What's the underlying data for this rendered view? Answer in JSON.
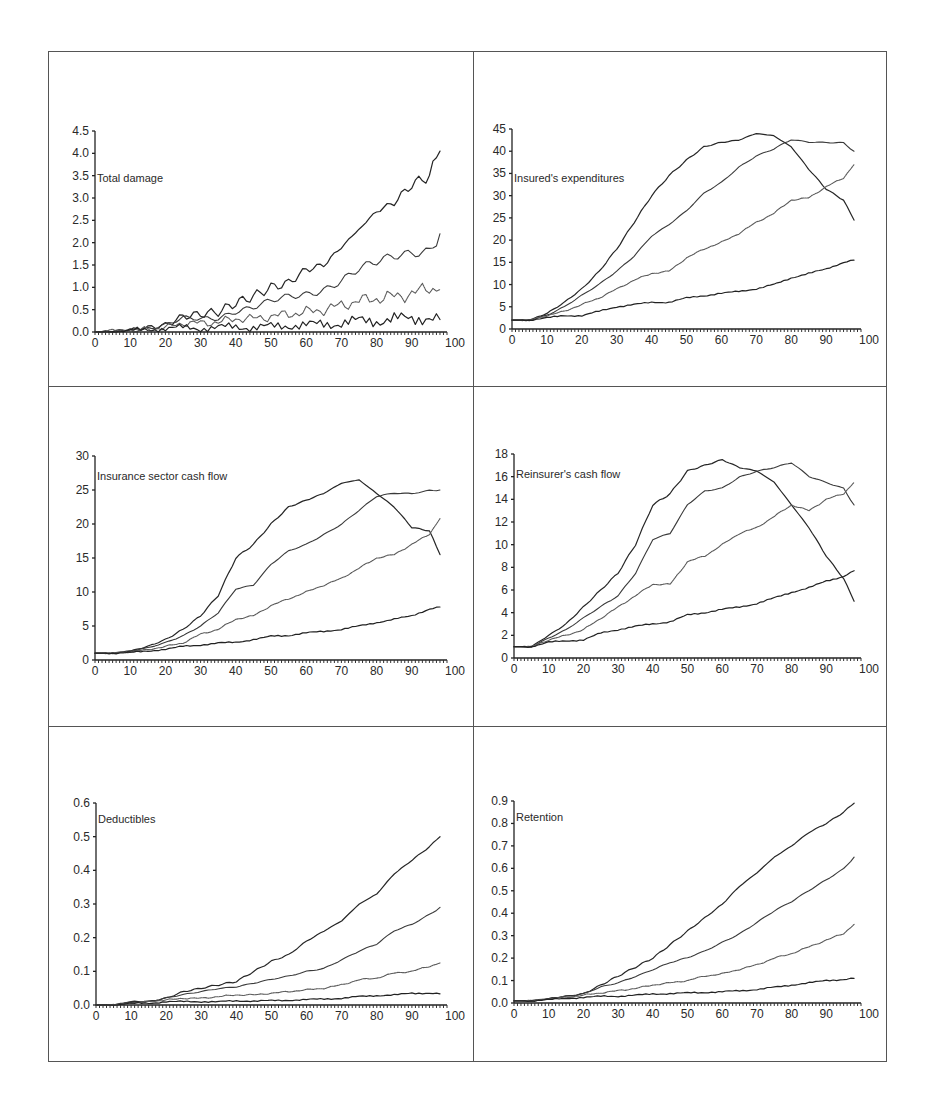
{
  "figure": {
    "panels_layout": "3 rows x 2 columns",
    "line_color": "#2b2b2b",
    "series_styles": [
      {
        "stroke": "#262626",
        "width": 1.2,
        "dash": ""
      },
      {
        "stroke": "#3a3a3a",
        "width": 1.1,
        "dash": ""
      },
      {
        "stroke": "#5a5a5a",
        "width": 1.1,
        "dash": "1.5,0.8"
      },
      {
        "stroke": "#222222",
        "width": 1.2,
        "dash": ""
      }
    ]
  },
  "chart_data": [
    {
      "id": "total-damage",
      "type": "line",
      "title": "Total damage",
      "xlabel": "",
      "ylabel": "",
      "xlim": [
        0,
        100
      ],
      "ylim": [
        0,
        4.5
      ],
      "yticks": [
        "0.0",
        "0.5",
        "1.0",
        "1.5",
        "2.0",
        "2.5",
        "3.0",
        "3.5",
        "4.0",
        "4.5"
      ],
      "ytick_values": [
        0,
        0.5,
        1,
        1.5,
        2,
        2.5,
        3,
        3.5,
        4,
        4.5
      ],
      "xticks": [
        "0",
        "10",
        "20",
        "30",
        "40",
        "50",
        "60",
        "70",
        "80",
        "90",
        "100"
      ],
      "grid": false,
      "legend": "none",
      "x": [
        0,
        5,
        10,
        15,
        20,
        25,
        30,
        35,
        40,
        45,
        50,
        55,
        60,
        65,
        70,
        75,
        80,
        85,
        90,
        95,
        98
      ],
      "series": [
        {
          "name": "series-1",
          "values": [
            0,
            0.02,
            0.05,
            0.1,
            0.15,
            0.35,
            0.4,
            0.45,
            0.65,
            0.8,
            1.0,
            1.1,
            1.4,
            1.5,
            1.9,
            2.3,
            2.7,
            2.9,
            3.3,
            3.5,
            4.05
          ]
        },
        {
          "name": "series-2",
          "values": [
            0,
            0.02,
            0.05,
            0.08,
            0.12,
            0.28,
            0.3,
            0.35,
            0.5,
            0.55,
            0.65,
            0.75,
            0.85,
            1.0,
            1.2,
            1.4,
            1.5,
            1.65,
            1.8,
            1.9,
            2.2
          ]
        },
        {
          "name": "series-3",
          "values": [
            0,
            0.02,
            0.04,
            0.06,
            0.1,
            0.2,
            0.2,
            0.22,
            0.3,
            0.3,
            0.35,
            0.4,
            0.45,
            0.5,
            0.6,
            0.7,
            0.75,
            0.8,
            0.85,
            1.0,
            0.95
          ]
        },
        {
          "name": "series-4",
          "values": [
            0,
            0.01,
            0.03,
            0.05,
            0.08,
            0.1,
            0.08,
            0.1,
            0.12,
            0.1,
            0.12,
            0.15,
            0.15,
            0.18,
            0.2,
            0.25,
            0.25,
            0.3,
            0.28,
            0.35,
            0.28
          ]
        }
      ]
    },
    {
      "id": "insureds-expenditures",
      "type": "line",
      "title": "Insured's expenditures",
      "xlabel": "",
      "ylabel": "",
      "xlim": [
        0,
        100
      ],
      "ylim": [
        0,
        45
      ],
      "yticks": [
        "0",
        "5",
        "10",
        "15",
        "20",
        "25",
        "30",
        "35",
        "40",
        "45"
      ],
      "ytick_values": [
        0,
        5,
        10,
        15,
        20,
        25,
        30,
        35,
        40,
        45
      ],
      "xticks": [
        "0",
        "10",
        "20",
        "30",
        "40",
        "50",
        "60",
        "70",
        "80",
        "90",
        "100"
      ],
      "grid": false,
      "legend": "none",
      "x": [
        0,
        5,
        10,
        15,
        20,
        25,
        30,
        35,
        40,
        45,
        50,
        55,
        60,
        65,
        70,
        75,
        80,
        85,
        90,
        95,
        98
      ],
      "series": [
        {
          "name": "series-1",
          "values": [
            2,
            2,
            3.5,
            6,
            9,
            13,
            18,
            24,
            30,
            34.5,
            38,
            41,
            42,
            42.5,
            44,
            43.5,
            41,
            36,
            31.5,
            29,
            24.5
          ]
        },
        {
          "name": "series-2",
          "values": [
            2,
            2,
            3.2,
            5,
            7.5,
            10,
            13,
            16.5,
            21,
            23.5,
            26.5,
            30.5,
            33,
            36.5,
            39,
            40.5,
            42.5,
            42,
            42,
            42,
            40
          ]
        },
        {
          "name": "series-3",
          "values": [
            2,
            2,
            3,
            4,
            5.5,
            7,
            9,
            11,
            12.5,
            13,
            16,
            18,
            19.5,
            21.5,
            24,
            26,
            29,
            29.5,
            32,
            34,
            37
          ]
        },
        {
          "name": "series-4",
          "values": [
            2,
            2,
            2.5,
            3,
            3,
            4,
            5,
            5.5,
            6,
            6,
            7,
            7.5,
            8,
            8.5,
            9,
            10,
            11.5,
            12.5,
            13.5,
            15,
            15.5
          ]
        }
      ]
    },
    {
      "id": "insurance-sector-cash-flow",
      "type": "line",
      "title": "Insurance sector cash flow",
      "xlabel": "",
      "ylabel": "",
      "xlim": [
        0,
        100
      ],
      "ylim": [
        0,
        30
      ],
      "yticks": [
        "0",
        "5",
        "10",
        "15",
        "20",
        "25",
        "30"
      ],
      "ytick_values": [
        0,
        5,
        10,
        15,
        20,
        25,
        30
      ],
      "xticks": [
        "0",
        "10",
        "20",
        "30",
        "40",
        "50",
        "60",
        "70",
        "80",
        "90",
        "100"
      ],
      "grid": false,
      "legend": "none",
      "x": [
        0,
        5,
        10,
        15,
        20,
        25,
        30,
        35,
        40,
        45,
        50,
        55,
        60,
        65,
        70,
        75,
        80,
        85,
        90,
        95,
        98
      ],
      "series": [
        {
          "name": "series-1",
          "values": [
            1,
            1,
            1.3,
            2,
            3,
            4.5,
            6.5,
            9.5,
            15,
            17,
            20,
            22.5,
            23.5,
            24.5,
            26,
            26.5,
            24.5,
            22.5,
            19.5,
            19,
            15.5
          ]
        },
        {
          "name": "series-2",
          "values": [
            1,
            1,
            1.4,
            1.8,
            2.5,
            3.5,
            5,
            7,
            10.5,
            11,
            14,
            16,
            17,
            18.5,
            20,
            22,
            24,
            24.5,
            24.5,
            25,
            25
          ]
        },
        {
          "name": "series-3",
          "values": [
            1,
            1,
            1.2,
            1.5,
            2,
            2.5,
            3.8,
            4.5,
            6,
            6.5,
            8,
            9,
            10,
            11,
            12,
            13.5,
            15,
            15.5,
            17,
            18.5,
            20.8
          ]
        },
        {
          "name": "series-4",
          "values": [
            1,
            1,
            1.1,
            1.3,
            1.6,
            2,
            2.2,
            2.5,
            2.6,
            3,
            3.5,
            3.6,
            4,
            4.2,
            4.5,
            5,
            5.5,
            6,
            6.5,
            7.5,
            7.8
          ]
        }
      ]
    },
    {
      "id": "reinsurers-cash-flow",
      "type": "line",
      "title": "Reinsurer's cash flow",
      "xlabel": "",
      "ylabel": "",
      "xlim": [
        0,
        100
      ],
      "ylim": [
        0,
        18
      ],
      "yticks": [
        "0",
        "2",
        "4",
        "6",
        "8",
        "10",
        "12",
        "14",
        "16",
        "18"
      ],
      "ytick_values": [
        0,
        2,
        4,
        6,
        8,
        10,
        12,
        14,
        16,
        18
      ],
      "xticks": [
        "0",
        "10",
        "20",
        "30",
        "40",
        "50",
        "60",
        "70",
        "80",
        "90",
        "100"
      ],
      "grid": false,
      "legend": "none",
      "x": [
        0,
        5,
        10,
        15,
        20,
        25,
        30,
        35,
        40,
        45,
        50,
        55,
        60,
        65,
        70,
        75,
        80,
        85,
        90,
        95,
        98
      ],
      "series": [
        {
          "name": "series-1",
          "values": [
            1,
            1,
            2,
            3,
            4.5,
            6,
            7.5,
            10,
            13.5,
            14.5,
            16.5,
            17,
            17.5,
            16.8,
            16.5,
            15.5,
            13.5,
            11.5,
            9,
            7,
            5
          ]
        },
        {
          "name": "series-2",
          "values": [
            1,
            1,
            1.8,
            2.5,
            3.5,
            4.5,
            5.5,
            7.5,
            10.5,
            11,
            13.5,
            14.7,
            15,
            16,
            16.5,
            16.8,
            17.2,
            16,
            15.5,
            15,
            13.5
          ]
        },
        {
          "name": "series-3",
          "values": [
            1,
            1,
            1.6,
            2,
            2.5,
            3.5,
            4.5,
            5.5,
            6.5,
            6.5,
            8.5,
            9,
            10,
            11,
            11.5,
            12.5,
            13.5,
            13,
            14,
            14.5,
            15.5
          ]
        },
        {
          "name": "series-4",
          "values": [
            1,
            1,
            1.4,
            1.5,
            1.6,
            2.2,
            2.5,
            2.8,
            3,
            3.2,
            3.8,
            4,
            4.3,
            4.5,
            4.8,
            5.3,
            5.8,
            6.2,
            6.8,
            7.2,
            7.7
          ]
        }
      ]
    },
    {
      "id": "deductibles",
      "type": "line",
      "title": "Deductibles",
      "xlabel": "",
      "ylabel": "",
      "xlim": [
        0,
        100
      ],
      "ylim": [
        0,
        0.6
      ],
      "yticks": [
        "0.0",
        "0.1",
        "0.2",
        "0.3",
        "0.4",
        "0.5",
        "0.6"
      ],
      "ytick_values": [
        0,
        0.1,
        0.2,
        0.3,
        0.4,
        0.5,
        0.6
      ],
      "xticks": [
        "0",
        "10",
        "20",
        "30",
        "40",
        "50",
        "60",
        "70",
        "80",
        "90",
        "100"
      ],
      "grid": false,
      "legend": "none",
      "x": [
        0,
        5,
        10,
        15,
        20,
        25,
        30,
        35,
        40,
        45,
        50,
        55,
        60,
        65,
        70,
        75,
        80,
        85,
        90,
        95,
        98
      ],
      "series": [
        {
          "name": "series-1",
          "values": [
            0,
            0,
            0.01,
            0.01,
            0.02,
            0.04,
            0.05,
            0.06,
            0.07,
            0.1,
            0.13,
            0.15,
            0.19,
            0.22,
            0.25,
            0.3,
            0.33,
            0.39,
            0.43,
            0.47,
            0.5
          ]
        },
        {
          "name": "series-2",
          "values": [
            0,
            0,
            0.01,
            0.01,
            0.02,
            0.03,
            0.04,
            0.05,
            0.055,
            0.065,
            0.075,
            0.085,
            0.1,
            0.11,
            0.135,
            0.16,
            0.18,
            0.22,
            0.24,
            0.27,
            0.29
          ]
        },
        {
          "name": "series-3",
          "values": [
            0,
            0,
            0.005,
            0.01,
            0.015,
            0.02,
            0.02,
            0.025,
            0.03,
            0.03,
            0.035,
            0.04,
            0.045,
            0.05,
            0.06,
            0.075,
            0.08,
            0.095,
            0.1,
            0.115,
            0.125
          ]
        },
        {
          "name": "series-4",
          "values": [
            0,
            0,
            0.005,
            0.005,
            0.01,
            0.01,
            0.01,
            0.01,
            0.012,
            0.012,
            0.013,
            0.014,
            0.016,
            0.018,
            0.02,
            0.025,
            0.028,
            0.03,
            0.035,
            0.035,
            0.033
          ]
        }
      ]
    },
    {
      "id": "retention",
      "type": "line",
      "title": "Retention",
      "xlabel": "",
      "ylabel": "",
      "xlim": [
        0,
        100
      ],
      "ylim": [
        0,
        0.9
      ],
      "yticks": [
        "0.0",
        "0.1",
        "0.2",
        "0.3",
        "0.4",
        "0.5",
        "0.6",
        "0.7",
        "0.8",
        "0.9"
      ],
      "ytick_values": [
        0,
        0.1,
        0.2,
        0.3,
        0.4,
        0.5,
        0.6,
        0.7,
        0.8,
        0.9
      ],
      "xticks": [
        "0",
        "10",
        "20",
        "30",
        "40",
        "50",
        "60",
        "70",
        "80",
        "90",
        "100"
      ],
      "grid": false,
      "legend": "none",
      "x": [
        0,
        5,
        10,
        15,
        20,
        25,
        30,
        35,
        40,
        45,
        50,
        55,
        60,
        65,
        70,
        75,
        80,
        85,
        90,
        95,
        98
      ],
      "series": [
        {
          "name": "series-1",
          "values": [
            0.01,
            0.01,
            0.02,
            0.03,
            0.04,
            0.08,
            0.12,
            0.16,
            0.2,
            0.26,
            0.32,
            0.38,
            0.44,
            0.52,
            0.58,
            0.65,
            0.7,
            0.76,
            0.8,
            0.85,
            0.89
          ]
        },
        {
          "name": "series-2",
          "values": [
            0.01,
            0.01,
            0.02,
            0.03,
            0.04,
            0.07,
            0.09,
            0.12,
            0.15,
            0.18,
            0.2,
            0.23,
            0.27,
            0.31,
            0.36,
            0.41,
            0.45,
            0.5,
            0.55,
            0.6,
            0.65
          ]
        },
        {
          "name": "series-3",
          "values": [
            0.01,
            0.01,
            0.02,
            0.025,
            0.035,
            0.045,
            0.055,
            0.065,
            0.08,
            0.09,
            0.1,
            0.12,
            0.13,
            0.15,
            0.17,
            0.2,
            0.22,
            0.25,
            0.28,
            0.31,
            0.35
          ]
        },
        {
          "name": "series-4",
          "values": [
            0.01,
            0.01,
            0.015,
            0.02,
            0.025,
            0.03,
            0.03,
            0.035,
            0.04,
            0.042,
            0.045,
            0.047,
            0.05,
            0.055,
            0.06,
            0.07,
            0.08,
            0.09,
            0.1,
            0.105,
            0.11
          ]
        }
      ]
    }
  ]
}
